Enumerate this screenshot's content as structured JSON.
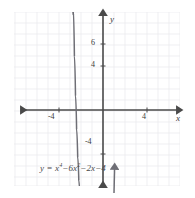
{
  "figure": {
    "background_color": "#ffffff",
    "grid_color": "#e6e6ea",
    "axis_color": "#4a4a4a",
    "curve_color": "#6e6e75"
  },
  "chart_data": {
    "type": "line",
    "title": "",
    "equation_label": "y = x⁴ − 6x² − 2x − 4",
    "equation_parts": {
      "lhs": "y",
      "equals": "=",
      "term1_base": "x",
      "term1_exp": "4",
      "term2_sign": "−",
      "term2_coef": "6",
      "term2_base": "x",
      "term2_exp": "2",
      "term3_sign": "−",
      "term3": "2x",
      "term4_sign": "−",
      "term4": "4"
    },
    "xlabel": "x",
    "ylabel": "y",
    "xlim": [
      -8,
      8
    ],
    "ylim": [
      -9,
      9
    ],
    "grid": true,
    "grid_step": 1,
    "legend": "none",
    "x_ticks": [
      {
        "value": -4,
        "label": "-4"
      },
      {
        "value": 4,
        "label": "4"
      }
    ],
    "y_ticks": [
      {
        "value": 6,
        "label": "6"
      },
      {
        "value": 4,
        "label": "4"
      },
      {
        "value": -4,
        "label": "-4"
      }
    ],
    "series": [
      {
        "name": "y = x^4 - 6x^2 - 2x - 4",
        "x": [
          -2.7,
          -2.6,
          -2.5,
          -2.4,
          -2.3,
          -2.2,
          -2.1,
          -2.0,
          -1.9,
          -1.8,
          -1.7,
          -1.6,
          -1.5,
          -1.4,
          -1.3,
          -1.2,
          -1.1,
          -1.0,
          -0.9,
          -0.8,
          -0.7,
          -0.6,
          -0.5,
          -0.4,
          -0.3,
          -0.2,
          -0.1,
          0.0,
          0.1,
          0.2,
          0.3,
          0.4,
          0.5,
          0.6,
          0.7,
          0.8,
          0.9,
          1.0,
          1.1,
          1.2,
          1.3,
          1.4,
          1.5,
          1.6,
          1.7,
          1.8,
          1.9,
          2.0,
          2.1,
          2.2,
          2.3,
          2.4,
          2.5,
          2.6,
          2.7
        ],
        "y": [
          9.09,
          4.9,
          1.31,
          -1.74,
          -4.29,
          -6.38,
          -8.05,
          -9.35,
          -10.31,
          -10.98,
          -11.39,
          -11.58,
          -11.59,
          -11.44,
          -11.18,
          -10.82,
          -10.4,
          -9.95,
          -9.48,
          -9.02,
          -8.59,
          -8.21,
          -7.88,
          -7.61,
          -7.42,
          -7.28,
          -7.2,
          -7.15,
          -7.14,
          -7.14,
          -7.16,
          -7.17,
          -7.19,
          -7.21,
          -7.24,
          -7.3,
          -7.4,
          -7.55,
          -7.78,
          -8.1,
          -8.52,
          -9.06,
          -9.72,
          -10.5,
          -11.4,
          -12.41,
          -13.5,
          -14.66,
          -15.86,
          -17.05,
          -18.19,
          -19.21,
          -20.04,
          -20.59,
          -20.75
        ]
      }
    ],
    "features": {
      "left_local_max_approx": {
        "x": -2.2,
        "y": 8.5
      },
      "local_min_left_approx": {
        "x": -1.9,
        "y": -4.0
      },
      "local_min_right_approx": {
        "x": 0.2,
        "y": -4.2
      },
      "right_local_max_approx": {
        "x": 1.6,
        "y": 2.0
      },
      "arrows": [
        "x-axis-left",
        "x-axis-right",
        "y-axis-up",
        "y-axis-down",
        "curve-left-down",
        "curve-right-down"
      ]
    }
  }
}
